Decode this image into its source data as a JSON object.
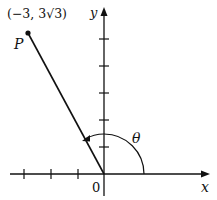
{
  "diagram": {
    "point_label": "P",
    "point_coords": "(−3, 3√3)",
    "angle_label": "θ",
    "x_axis_label": "x",
    "y_axis_label": "y",
    "origin_label": "0",
    "x_ticks_negative": 3,
    "y_ticks_positive": 5,
    "colors": {
      "ink": "#111111",
      "background": "#ffffff"
    }
  }
}
